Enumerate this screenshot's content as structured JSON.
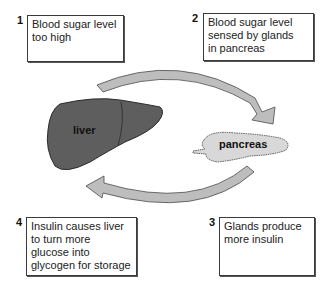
{
  "diagram": {
    "type": "cycle",
    "steps": [
      {
        "number": "1",
        "lines": [
          "Blood sugar level",
          "too high"
        ]
      },
      {
        "number": "2",
        "lines": [
          "Blood sugar level",
          "sensed by glands",
          "in pancreas"
        ]
      },
      {
        "number": "3",
        "lines": [
          "Glands produce",
          "more insulin"
        ]
      },
      {
        "number": "4",
        "lines": [
          "Insulin causes liver",
          "to turn more",
          "glucose into",
          "glycogen for storage"
        ]
      }
    ],
    "organs": {
      "liver": {
        "label": "liver",
        "color": "#5e5e5e"
      },
      "pancreas": {
        "label": "pancreas",
        "color": "#d8d8d8"
      }
    },
    "arrows": [
      {
        "name": "liver-to-pancreas",
        "direction": "clockwise-top",
        "fill": "#bdbdbd"
      },
      {
        "name": "pancreas-to-liver",
        "direction": "clockwise-bottom",
        "fill": "#bdbdbd"
      }
    ]
  }
}
